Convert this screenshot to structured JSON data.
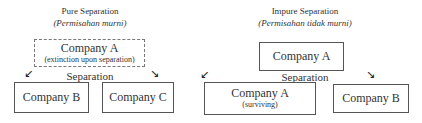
{
  "pure": {
    "title": "Pure Separation",
    "subtitle": "(Permisahan murni)",
    "parent": {
      "name": "Company A",
      "note": "(extinction upon separation)"
    },
    "separation_label": "Separation",
    "children": [
      {
        "name": "Company B"
      },
      {
        "name": "Company C"
      }
    ],
    "arrows": {
      "left": "↙",
      "right": "↘"
    }
  },
  "impure": {
    "title": "Impure Separation",
    "subtitle": "(Permisahan tidak murni)",
    "parent": {
      "name": "Company A"
    },
    "separation_label": "Separation",
    "children": [
      {
        "name": "Company A",
        "note": "(surviving)"
      },
      {
        "name": "Company B"
      }
    ],
    "arrows": {
      "left": "↙",
      "right": "↘"
    }
  }
}
